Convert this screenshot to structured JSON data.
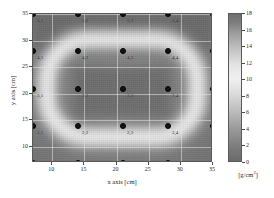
{
  "chart_data": {
    "type": "heatmap",
    "title": "",
    "xlabel": "x axis [cm]",
    "ylabel": "y axis [cm]",
    "xlim": [
      7,
      35
    ],
    "ylim": [
      7,
      35
    ],
    "xticks": [
      10,
      15,
      20,
      25,
      30,
      35
    ],
    "yticks": [
      10,
      15,
      20,
      25,
      30,
      35
    ],
    "grid": true,
    "legend_position": "none",
    "colorbar": {
      "label": "[g/cm²]",
      "unit": "g/cm²",
      "min": 0,
      "max": 18,
      "ticks": [
        0,
        2,
        4,
        6,
        8,
        10,
        12,
        14,
        16,
        18
      ],
      "colormap": "grayscale",
      "low_color": "#6b6b6b",
      "high_color": "#6e6e6e",
      "peak_color": "#f0f0f0"
    },
    "markers": {
      "marker_shape": "circle",
      "marker_color": "#151515",
      "grid_x": [
        7,
        14,
        21,
        28,
        35
      ],
      "grid_y": [
        7,
        14,
        21,
        28,
        35
      ],
      "points": [
        {
          "label": "5,1",
          "x": 7,
          "y": 35
        },
        {
          "label": "5,2",
          "x": 14,
          "y": 35
        },
        {
          "label": "5,3",
          "x": 21,
          "y": 35
        },
        {
          "label": "5,4",
          "x": 28,
          "y": 35
        },
        {
          "label": "5,5",
          "x": 35,
          "y": 35
        },
        {
          "label": "4,1",
          "x": 7,
          "y": 28
        },
        {
          "label": "4,2",
          "x": 14,
          "y": 28
        },
        {
          "label": "4,3",
          "x": 21,
          "y": 28
        },
        {
          "label": "4,4",
          "x": 28,
          "y": 28
        },
        {
          "label": "4,5",
          "x": 35,
          "y": 28
        },
        {
          "label": "3,1",
          "x": 7,
          "y": 21
        },
        {
          "label": "3,2",
          "x": 14,
          "y": 21
        },
        {
          "label": "3,3",
          "x": 21,
          "y": 21
        },
        {
          "label": "3,4",
          "x": 28,
          "y": 21
        },
        {
          "label": "3,5",
          "x": 35,
          "y": 21
        },
        {
          "label": "2,1",
          "x": 7,
          "y": 14
        },
        {
          "label": "2,2",
          "x": 14,
          "y": 14
        },
        {
          "label": "2,3",
          "x": 21,
          "y": 14
        },
        {
          "label": "2,4",
          "x": 28,
          "y": 14
        },
        {
          "label": "2,5",
          "x": 35,
          "y": 14
        },
        {
          "label": "1,1",
          "x": 7,
          "y": 7
        },
        {
          "label": "1,2",
          "x": 14,
          "y": 7
        },
        {
          "label": "1,3",
          "x": 21,
          "y": 7
        },
        {
          "label": "1,4",
          "x": 28,
          "y": 7
        },
        {
          "label": "1,5",
          "x": 35,
          "y": 7
        }
      ]
    },
    "field_description": "Bright high-value racetrack ring surrounding a darker central core, on a darker background; peak values near the ring."
  }
}
